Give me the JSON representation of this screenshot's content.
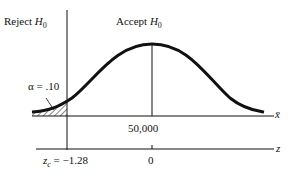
{
  "diagram": {
    "reject_label": "Reject",
    "accept_label": "Accept",
    "hypothesis": "H",
    "hypothesis_sub": "0",
    "alpha_label": "α = .10",
    "mean_label": "50,000",
    "xbar_axis_label": "x̄",
    "z_axis_label": "z",
    "zc_label_var": "z",
    "zc_label_sub": "c",
    "zc_value": " = −1.28",
    "zero_label": "0"
  }
}
